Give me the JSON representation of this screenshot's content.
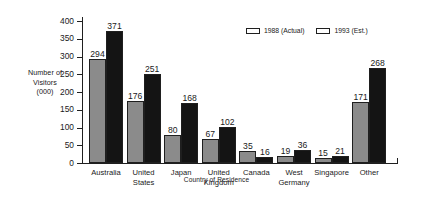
{
  "chart_data": {
    "type": "bar",
    "title": "",
    "xlabel": "Country of Residence",
    "ylabel": "Number of Visitors (000)",
    "ylabel_lines": [
      "Number of",
      "Visitors",
      "(000)"
    ],
    "ylim": [
      0,
      400
    ],
    "yticks": [
      0,
      50,
      100,
      150,
      200,
      250,
      300,
      350,
      400
    ],
    "grid": false,
    "legend_position": "top-right",
    "categories": [
      "Australia",
      "United States",
      "Japan",
      "United Kingdom",
      "Canada",
      "West Germany",
      "Singapore",
      "Other"
    ],
    "category_lines": [
      [
        "Australia"
      ],
      [
        "United",
        "States"
      ],
      [
        "Japan"
      ],
      [
        "United",
        "Kingdom"
      ],
      [
        "Canada"
      ],
      [
        "West",
        "Germany"
      ],
      [
        "Singapore"
      ],
      [
        "Other"
      ]
    ],
    "series": [
      {
        "name": "1988 (Actual)",
        "color": "#8b8b8b",
        "values": [
          294,
          176,
          80,
          67,
          35,
          19,
          15,
          171
        ]
      },
      {
        "name": "1993 (Est.)",
        "color": "#141414",
        "values": [
          371,
          251,
          168,
          102,
          16,
          36,
          21,
          268
        ]
      }
    ]
  },
  "legend": {
    "items": [
      {
        "label": "1988 (Actual)",
        "color": "#8b8b8b"
      },
      {
        "label": "1993 (Est.)",
        "color": "#141414"
      }
    ]
  }
}
